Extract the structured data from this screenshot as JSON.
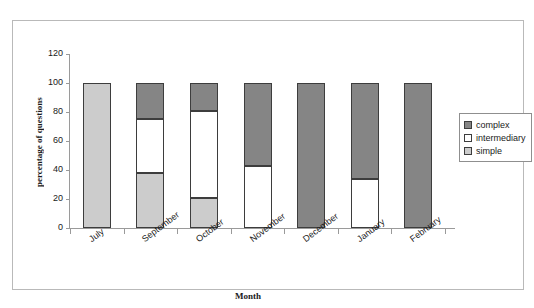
{
  "chart_data": {
    "type": "bar",
    "stacked": true,
    "title": "",
    "xlabel": "Month",
    "ylabel": "percentage of questions",
    "categories": [
      "July",
      "September",
      "October",
      "November",
      "December",
      "January",
      "February"
    ],
    "series": [
      {
        "name": "simple",
        "color": "#cccccc",
        "values": [
          100,
          38,
          21,
          0,
          0,
          0,
          0
        ]
      },
      {
        "name": "intermediary",
        "color": "#ffffff",
        "values": [
          0,
          37,
          60,
          43,
          0,
          34,
          0
        ]
      },
      {
        "name": "complex",
        "color": "#858585",
        "values": [
          0,
          25,
          19,
          57,
          100,
          66,
          100
        ]
      }
    ],
    "ylim": [
      0,
      120
    ],
    "yticks": [
      0,
      20,
      40,
      60,
      80,
      100,
      120
    ],
    "ytick_labels": [
      "0",
      "20",
      "40",
      "60",
      "80",
      "100",
      "120"
    ],
    "grid": false,
    "legend_position": "right",
    "legend_entries": [
      "complex",
      "intermediary",
      "simple"
    ]
  },
  "legend": {
    "items": [
      {
        "label": "complex",
        "color": "#858585"
      },
      {
        "label": "intermediary",
        "color": "#ffffff"
      },
      {
        "label": "simple",
        "color": "#cccccc"
      }
    ]
  }
}
